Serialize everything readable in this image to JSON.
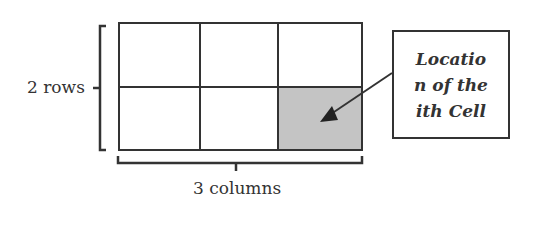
{
  "diagram": {
    "grid": {
      "rows": 2,
      "columns": 3,
      "highlighted_cell": {
        "row": 2,
        "column": 3
      }
    },
    "colors": {
      "line": "#333333",
      "highlight": "#c4c4c4",
      "background": "#ffffff"
    },
    "labels": {
      "rows": "2 rows",
      "columns": "3 columns"
    },
    "callout": {
      "lines": [
        "Locatio",
        "n of the",
        "ith Cell"
      ]
    }
  }
}
